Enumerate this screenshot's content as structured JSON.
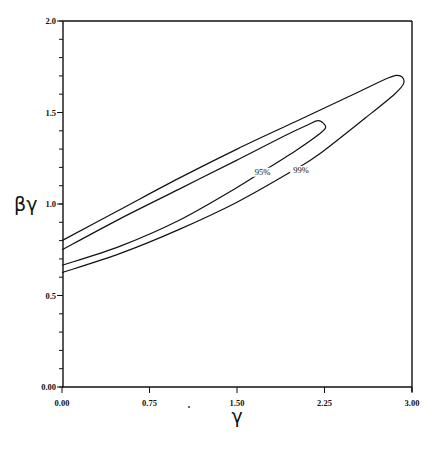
{
  "chart_data": {
    "type": "line",
    "title": "",
    "xlabel": "γ",
    "ylabel": "βγ",
    "xlim": [
      0,
      3.0
    ],
    "ylim": [
      0,
      2.0
    ],
    "x_ticks": [
      {
        "value": 0.0,
        "label": "0.00"
      },
      {
        "value": 0.75,
        "label": "0.75"
      },
      {
        "value": 1.5,
        "label": "1.50"
      },
      {
        "value": 2.25,
        "label": "2.25"
      },
      {
        "value": 3.0,
        "label": "3.00"
      }
    ],
    "y_ticks": [
      {
        "value": 0.0,
        "label": "0.00"
      },
      {
        "value": 0.5,
        "label": "0.5"
      },
      {
        "value": 1.0,
        "label": "1.0"
      },
      {
        "value": 1.5,
        "label": "1.5"
      },
      {
        "value": 2.0,
        "label": "2.0"
      }
    ],
    "y_minor_step": 0.1,
    "grid": false,
    "series": [
      {
        "name": "95%",
        "kind": "confidence-contour",
        "upper": [
          [
            0.0,
            0.75
          ],
          [
            0.5,
            0.92
          ],
          [
            1.0,
            1.08
          ],
          [
            1.5,
            1.24
          ],
          [
            1.9,
            1.37
          ],
          [
            2.1,
            1.43
          ],
          [
            2.2,
            1.455
          ]
        ],
        "tip": [
          2.26,
          1.42
        ],
        "lower": [
          [
            2.2,
            1.38
          ],
          [
            2.0,
            1.29
          ],
          [
            1.7,
            1.17
          ],
          [
            1.5,
            1.09
          ],
          [
            1.0,
            0.91
          ],
          [
            0.5,
            0.77
          ],
          [
            0.0,
            0.665
          ]
        ],
        "label_position": [
          1.72,
          1.16
        ]
      },
      {
        "name": "99%",
        "kind": "confidence-contour",
        "upper": [
          [
            0.0,
            0.8
          ],
          [
            0.5,
            0.97
          ],
          [
            1.0,
            1.14
          ],
          [
            1.5,
            1.3
          ],
          [
            2.0,
            1.45
          ],
          [
            2.5,
            1.6
          ],
          [
            2.8,
            1.69
          ],
          [
            2.9,
            1.7
          ]
        ],
        "tip": [
          2.93,
          1.66
        ],
        "lower": [
          [
            2.85,
            1.6
          ],
          [
            2.6,
            1.47
          ],
          [
            2.2,
            1.27
          ],
          [
            2.0,
            1.19
          ],
          [
            1.5,
            1.01
          ],
          [
            1.0,
            0.86
          ],
          [
            0.5,
            0.73
          ],
          [
            0.0,
            0.625
          ]
        ],
        "label_position": [
          2.05,
          1.17
        ]
      }
    ]
  }
}
